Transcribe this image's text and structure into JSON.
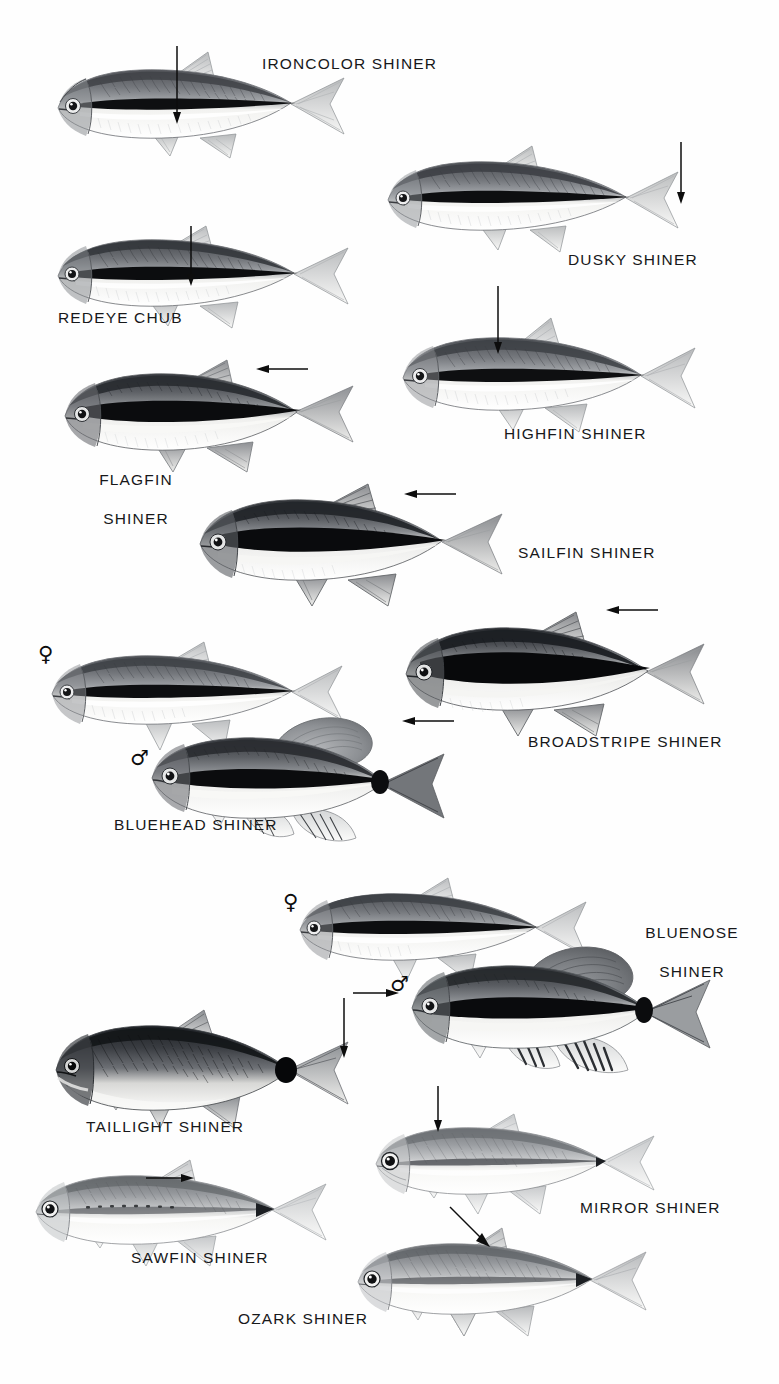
{
  "plate": {
    "kind": "field-guide-illustration-plate",
    "subject": "North American shiner and chub minnow species",
    "width": 779,
    "height": 1384,
    "background_color": "#ffffff",
    "ink_color": "#17181a",
    "medium": "grayscale pencil / airbrush illustration",
    "sections": 2
  },
  "symbols": {
    "female": "♀",
    "male": "♂"
  },
  "species": [
    {
      "id": "ironcolor-shiner",
      "label": "IRONCOLOR SHINER",
      "label_lines": [
        "IRONCOLOR SHINER"
      ],
      "label_x": 262,
      "label_y": 54,
      "fish_x": 48,
      "fish_y": 46,
      "fish_w": 300,
      "fish_h": 118,
      "flip": false,
      "body_tone": "medium",
      "stripe": "bold-black-lateral",
      "arrow": {
        "type": "down",
        "x": 176,
        "y": 48,
        "len": 76
      },
      "sex_symbol": null
    },
    {
      "id": "dusky-shiner",
      "label": "DUSKY SHINER",
      "label_lines": [
        "DUSKY SHINER"
      ],
      "label_x": 568,
      "label_y": 252,
      "fish_x": 380,
      "fish_y": 142,
      "fish_w": 300,
      "fish_h": 115,
      "flip": false,
      "body_tone": "medium",
      "stripe": "bold-black-lateral",
      "arrow": {
        "type": "down",
        "x": 680,
        "y": 143,
        "len": 60
      },
      "sex_symbol": null
    },
    {
      "id": "redeye-chub",
      "label": "REDEYE CHUB",
      "label_lines": [
        "REDEYE CHUB"
      ],
      "label_x": 58,
      "label_y": 310,
      "fish_x": 50,
      "fish_y": 222,
      "fish_w": 300,
      "fish_h": 112,
      "flip": false,
      "body_tone": "medium-dark",
      "stripe": "bold-black-lateral",
      "arrow": {
        "type": "down",
        "x": 190,
        "y": 228,
        "len": 58
      },
      "sex_symbol": null
    },
    {
      "id": "highfin-shiner",
      "label": "HIGHFIN SHINER",
      "label_lines": [
        "HIGHFIN SHINER"
      ],
      "label_x": 504,
      "label_y": 425,
      "fish_x": 395,
      "fish_y": 316,
      "fish_w": 300,
      "fish_h": 120,
      "flip": false,
      "body_tone": "medium",
      "stripe": "bold-black-lateral",
      "arrow": {
        "type": "down",
        "x": 497,
        "y": 287,
        "len": 66
      },
      "sex_symbol": null
    },
    {
      "id": "flagfin-shiner",
      "label": "FLAGFIN SHINER",
      "label_lines": [
        "FLAGFIN",
        "SHINER"
      ],
      "label_x": 88,
      "label_y": 452,
      "fish_x": 57,
      "fish_y": 352,
      "fish_w": 300,
      "fish_h": 124,
      "flip": false,
      "body_tone": "dark",
      "stripe": "broad-black-lateral",
      "arrow": {
        "type": "left",
        "x": 256,
        "y": 368,
        "len": 44
      },
      "sex_symbol": null
    },
    {
      "id": "sailfin-shiner",
      "label": "SAILFIN SHINER",
      "label_lines": [
        "SAILFIN SHINER"
      ],
      "label_x": 518,
      "label_y": 545,
      "fish_x": 192,
      "fish_y": 478,
      "fish_w": 312,
      "fish_h": 132,
      "flip": false,
      "body_tone": "dark",
      "stripe": "broad-black-lateral",
      "arrow": {
        "type": "left",
        "x": 404,
        "y": 493,
        "len": 44
      },
      "sex_symbol": null
    },
    {
      "id": "broadstripe-shiner",
      "label": "BROADSTRIPE SHINER",
      "label_lines": [
        "BROADSTRIPE SHINER"
      ],
      "label_x": 528,
      "label_y": 733,
      "fish_x": 398,
      "fish_y": 604,
      "fish_w": 308,
      "fish_h": 136,
      "flip": false,
      "body_tone": "very-dark",
      "stripe": "very-broad-black-lateral",
      "arrow": {
        "type": "left",
        "x": 606,
        "y": 609,
        "len": 44
      },
      "sex_symbol": null
    },
    {
      "id": "bluehead-shiner-female",
      "label": "BLUEHEAD SHINER",
      "label_lines": [
        "BLUEHEAD SHINER"
      ],
      "label_x": 116,
      "label_y": 817,
      "fish_x": 44,
      "fish_y": 634,
      "fish_w": 296,
      "fish_h": 128,
      "flip": false,
      "body_tone": "medium-dark",
      "stripe": "black-lateral",
      "arrow": null,
      "sex_symbol": "female",
      "sex_x": 38,
      "sex_y": 646
    },
    {
      "id": "bluehead-shiner-male",
      "label": null,
      "label_lines": [],
      "fish_x": 140,
      "fish_y": 710,
      "fish_w": 322,
      "fish_h": 136,
      "flip": false,
      "body_tone": "dark",
      "stripe": "bold-black-lateral",
      "arrow": {
        "type": "left",
        "x": 402,
        "y": 722,
        "len": 44
      },
      "sex_symbol": "male",
      "sex_x": 133,
      "sex_y": 748
    },
    {
      "id": "bluenose-shiner-female",
      "label": "BLUENOSE SHINER",
      "label_lines": [
        "BLUENOSE",
        "SHINER"
      ],
      "label_x": 634,
      "label_y": 905,
      "fish_x": 288,
      "fish_y": 872,
      "fish_w": 300,
      "fish_h": 116,
      "flip": false,
      "body_tone": "medium",
      "stripe": "bold-black-lateral",
      "arrow": null,
      "sex_symbol": "female",
      "sex_x": 285,
      "sex_y": 893
    },
    {
      "id": "bluenose-shiner-male",
      "label": null,
      "label_lines": [],
      "fish_x": 400,
      "fish_y": 938,
      "fish_w": 328,
      "fish_h": 140,
      "flip": false,
      "body_tone": "dark",
      "stripe": "bold-black-lateral",
      "arrow": {
        "type": "right",
        "x": 357,
        "y": 992,
        "len": 40
      },
      "sex_symbol": "male",
      "sex_x": 392,
      "sex_y": 975
    },
    {
      "id": "taillight-shiner",
      "label": "TAILLIGHT SHINER",
      "label_lines": [
        "TAILLIGHT SHINER"
      ],
      "label_x": 88,
      "label_y": 1118,
      "fish_x": 48,
      "fish_y": 1000,
      "fish_w": 300,
      "fish_h": 130,
      "flip": false,
      "body_tone": "very-dark",
      "stripe": "caudal-spot",
      "arrow": {
        "type": "down",
        "x": 343,
        "y": 1002,
        "len": 56
      },
      "sex_symbol": null
    },
    {
      "id": "mirror-shiner",
      "label": "MIRROR SHINER",
      "label_lines": [
        "MIRROR SHINER"
      ],
      "label_x": 580,
      "label_y": 1200,
      "fish_x": 368,
      "fish_y": 1110,
      "fish_w": 286,
      "fish_h": 112,
      "flip": false,
      "body_tone": "light",
      "stripe": "faint-lateral",
      "arrow": {
        "type": "down",
        "x": 437,
        "y": 1088,
        "len": 42
      },
      "sex_symbol": null
    },
    {
      "id": "sawfin-shiner",
      "label": "SAWFIN SHINER",
      "label_lines": [
        "SAWFIN SHINER"
      ],
      "label_x": 133,
      "label_y": 1250,
      "fish_x": 28,
      "fish_y": 1160,
      "fish_w": 300,
      "fish_h": 116,
      "flip": false,
      "body_tone": "light",
      "stripe": "faint-lateral",
      "arrow": {
        "type": "right",
        "x": 148,
        "y": 1178,
        "len": 42
      },
      "sex_symbol": null
    },
    {
      "id": "ozark-shiner",
      "label": "OZARK SHINER",
      "label_lines": [
        "OZARK SHINER"
      ],
      "label_x": 240,
      "label_y": 1311,
      "fish_x": 350,
      "fish_y": 1222,
      "fish_w": 300,
      "fish_h": 118,
      "flip": false,
      "body_tone": "light",
      "stripe": "faint-lateral",
      "arrow": {
        "type": "diag-down-right",
        "x": 456,
        "y": 1212,
        "len": 48
      },
      "sex_symbol": null
    }
  ]
}
